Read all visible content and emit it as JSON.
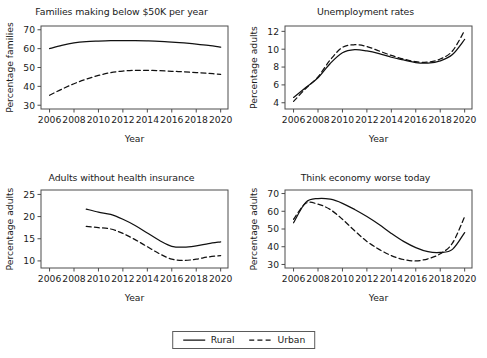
{
  "figure": {
    "width": 487,
    "height": 358,
    "background": "#ffffff",
    "line_color": "#111111",
    "frame_color": "#4d4d4d"
  },
  "legend": {
    "position": "bottom-center",
    "entries": [
      {
        "label": "Rural",
        "style": "solid",
        "name": "legend-rural"
      },
      {
        "label": "Urban",
        "style": "dashed",
        "name": "legend-urban"
      }
    ]
  },
  "chart_data": [
    {
      "type": "line",
      "title": "Families making below $50K per year",
      "xlabel": "Year",
      "ylabel": "Percentage families",
      "xlim": [
        2005.3,
        2020.6
      ],
      "ylim": [
        28,
        72
      ],
      "xticks": [
        2006,
        2008,
        2010,
        2012,
        2014,
        2016,
        2018,
        2020
      ],
      "yticks": [
        30,
        40,
        50,
        60,
        70
      ],
      "grid": false,
      "x": [
        2006,
        2007,
        2008,
        2009,
        2010,
        2011,
        2012,
        2013,
        2014,
        2015,
        2016,
        2017,
        2018,
        2019,
        2020
      ],
      "series": [
        {
          "name": "Rural",
          "style": "solid",
          "values": [
            60.0,
            61.7,
            63.0,
            63.7,
            64.0,
            64.2,
            64.2,
            64.2,
            64.1,
            63.9,
            63.5,
            63.0,
            62.4,
            61.7,
            60.8
          ]
        },
        {
          "name": "Urban",
          "style": "dashed",
          "values": [
            35.3,
            38.5,
            41.4,
            43.8,
            45.8,
            47.3,
            48.1,
            48.5,
            48.5,
            48.3,
            48.0,
            47.7,
            47.3,
            46.9,
            46.4
          ]
        }
      ]
    },
    {
      "type": "line",
      "title": "Unemployment rates",
      "xlabel": "Year",
      "ylabel": "Percentage adults",
      "xlim": [
        2005.3,
        2020.6
      ],
      "ylim": [
        3.3,
        12.6
      ],
      "xticks": [
        2006,
        2008,
        2010,
        2012,
        2014,
        2016,
        2018,
        2020
      ],
      "yticks": [
        4,
        6,
        8,
        10,
        12
      ],
      "grid": false,
      "x": [
        2006,
        2007,
        2008,
        2009,
        2010,
        2011,
        2012,
        2013,
        2014,
        2015,
        2016,
        2017,
        2018,
        2019,
        2020
      ],
      "series": [
        {
          "name": "Rural",
          "style": "solid",
          "values": [
            4.6,
            5.7,
            6.8,
            8.4,
            9.6,
            9.95,
            9.8,
            9.5,
            9.1,
            8.8,
            8.5,
            8.45,
            8.7,
            9.4,
            11.1
          ]
        },
        {
          "name": "Urban",
          "style": "dashed",
          "values": [
            4.15,
            5.6,
            6.9,
            8.8,
            10.2,
            10.5,
            10.3,
            9.8,
            9.3,
            8.9,
            8.6,
            8.55,
            8.9,
            9.8,
            12.1
          ]
        }
      ]
    },
    {
      "type": "line",
      "title": "Adults without health insurance",
      "xlabel": "Year",
      "ylabel": "Percentage adults",
      "xlim": [
        2005.3,
        2020.6
      ],
      "ylim": [
        8.4,
        26
      ],
      "xticks": [
        2006,
        2008,
        2010,
        2012,
        2014,
        2016,
        2018,
        2020
      ],
      "yticks": [
        10,
        15,
        20,
        25
      ],
      "grid": false,
      "x": [
        2009,
        2010,
        2011,
        2012,
        2013,
        2014,
        2015,
        2016,
        2017,
        2018,
        2019,
        2020
      ],
      "series": [
        {
          "name": "Rural",
          "style": "solid",
          "values": [
            21.7,
            21.0,
            20.5,
            19.4,
            18.0,
            16.3,
            14.6,
            13.3,
            13.1,
            13.4,
            13.9,
            14.3
          ]
        },
        {
          "name": "Urban",
          "style": "dashed",
          "values": [
            17.8,
            17.5,
            17.2,
            16.2,
            14.8,
            13.2,
            11.6,
            10.4,
            10.1,
            10.4,
            10.9,
            11.2
          ]
        }
      ]
    },
    {
      "type": "line",
      "title": "Think economy worse today",
      "xlabel": "Year",
      "ylabel": "Percentage adults",
      "xlim": [
        2005.3,
        2020.6
      ],
      "ylim": [
        28,
        72
      ],
      "xticks": [
        2006,
        2008,
        2010,
        2012,
        2014,
        2016,
        2018,
        2020
      ],
      "yticks": [
        30,
        40,
        50,
        60,
        70
      ],
      "grid": false,
      "x": [
        2006,
        2007,
        2008,
        2009,
        2010,
        2011,
        2012,
        2013,
        2014,
        2015,
        2016,
        2017,
        2018,
        2019,
        2020
      ],
      "series": [
        {
          "name": "Rural",
          "style": "solid",
          "values": [
            53.5,
            65.0,
            67.2,
            66.8,
            64.5,
            61.0,
            57.0,
            52.5,
            47.5,
            43.0,
            39.5,
            37.2,
            36.8,
            38.5,
            48.0
          ]
        },
        {
          "name": "Urban",
          "style": "dashed",
          "values": [
            55.5,
            64.5,
            64.0,
            61.0,
            55.5,
            49.0,
            43.0,
            38.5,
            35.0,
            32.8,
            32.0,
            33.2,
            36.0,
            42.0,
            57.0
          ]
        }
      ]
    }
  ]
}
